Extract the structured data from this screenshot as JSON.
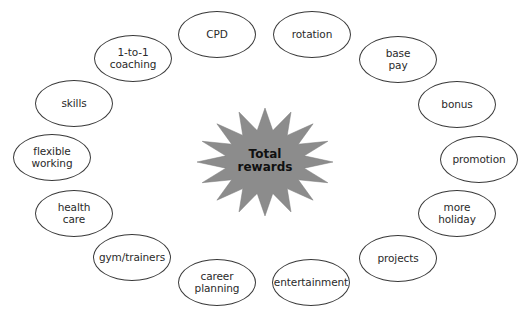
{
  "diagram": {
    "type": "hub-and-spoke",
    "center": {
      "label": "Total\nrewards",
      "shape": "starburst",
      "fill": "#8c8c8c"
    },
    "nodes": [
      {
        "id": "cpd",
        "label": "CPD",
        "cx": 217,
        "cy": 34
      },
      {
        "id": "rotation",
        "label": "rotation",
        "cx": 312,
        "cy": 34
      },
      {
        "id": "base-pay",
        "label": "base\npay",
        "cx": 398,
        "cy": 59
      },
      {
        "id": "bonus",
        "label": "bonus",
        "cx": 457,
        "cy": 104
      },
      {
        "id": "promotion",
        "label": "promotion",
        "cx": 479,
        "cy": 159
      },
      {
        "id": "more-holiday",
        "label": "more\nholiday",
        "cx": 457,
        "cy": 213
      },
      {
        "id": "projects",
        "label": "projects",
        "cx": 398,
        "cy": 258
      },
      {
        "id": "entertainment",
        "label": "entertainment",
        "cx": 311,
        "cy": 282
      },
      {
        "id": "career-planning",
        "label": "career\nplanning",
        "cx": 217,
        "cy": 282
      },
      {
        "id": "gym-trainers",
        "label": "gym/trainers",
        "cx": 132,
        "cy": 257
      },
      {
        "id": "health-care",
        "label": "health\ncare",
        "cx": 74,
        "cy": 213
      },
      {
        "id": "flexible-working",
        "label": "flexible\nworking",
        "cx": 52,
        "cy": 157
      },
      {
        "id": "skills",
        "label": "skills",
        "cx": 74,
        "cy": 103
      },
      {
        "id": "1-to-1-coaching",
        "label": "1-to-1\ncoaching",
        "cx": 133,
        "cy": 58
      }
    ],
    "colors": {
      "background": "#ffffff",
      "ellipse_stroke": "#3a3a3a",
      "text": "#2a2a2a",
      "star_fill": "#8c8c8c"
    }
  }
}
